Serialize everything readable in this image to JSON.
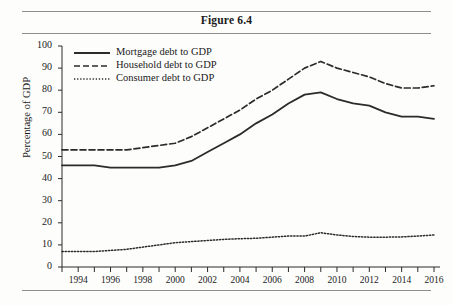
{
  "figure": {
    "title": "Figure 6.4"
  },
  "chart_data": {
    "type": "line",
    "title": "Figure 6.4",
    "xlabel": "",
    "ylabel": "Percentage of GDP",
    "xlim": [
      1993,
      2016
    ],
    "ylim": [
      0,
      100
    ],
    "grid": false,
    "legend_position": "top-left inside plot",
    "y_ticks": [
      0,
      10,
      20,
      30,
      40,
      50,
      60,
      70,
      80,
      90,
      100
    ],
    "y_tick_labels": [
      "0",
      "10",
      "20",
      "30",
      "40",
      "50",
      "60",
      "70",
      "80",
      "90",
      "100"
    ],
    "x_ticks": [
      1994,
      1996,
      1998,
      2000,
      2002,
      2004,
      2006,
      2008,
      2010,
      2012,
      2014,
      2016
    ],
    "x_tick_labels": [
      "1994",
      "1996",
      "1998",
      "2000",
      "2002",
      "2004",
      "2006",
      "2008",
      "2010",
      "2012",
      "2014",
      "2016"
    ],
    "x_minor_ticks": [
      1993,
      1994,
      1995,
      1996,
      1997,
      1998,
      1999,
      2000,
      2001,
      2002,
      2003,
      2004,
      2005,
      2006,
      2007,
      2008,
      2009,
      2010,
      2011,
      2012,
      2013,
      2014,
      2015,
      2016
    ],
    "x": [
      1993,
      1994,
      1995,
      1996,
      1997,
      1998,
      1999,
      2000,
      2001,
      2002,
      2003,
      2004,
      2005,
      2006,
      2007,
      2008,
      2009,
      2010,
      2011,
      2012,
      2013,
      2014,
      2015,
      2016
    ],
    "series": [
      {
        "name": "Mortgage debt to GDP",
        "style": "solid",
        "color": "#2b2b2b",
        "values": [
          46,
          46,
          46,
          45,
          45,
          45,
          45,
          46,
          48,
          52,
          56,
          60,
          65,
          69,
          74,
          78,
          79,
          76,
          74,
          73,
          70,
          68,
          68,
          67
        ]
      },
      {
        "name": "Household debt to GDP",
        "style": "dashed",
        "color": "#2b2b2b",
        "values": [
          53,
          53,
          53,
          53,
          53,
          54,
          55,
          56,
          59,
          63,
          67,
          71,
          76,
          80,
          85,
          90,
          93,
          90,
          88,
          86,
          83,
          81,
          81,
          82
        ]
      },
      {
        "name": "Consumer debt to GDP",
        "style": "dotted",
        "color": "#2b2b2b",
        "values": [
          7,
          7,
          7,
          7.5,
          8,
          9,
          10,
          11,
          11.5,
          12,
          12.5,
          12.8,
          13,
          13.5,
          14,
          14,
          15.5,
          14.5,
          13.8,
          13.5,
          13.5,
          13.6,
          14,
          14.5
        ]
      }
    ]
  },
  "legend": {
    "items": [
      {
        "label": "Mortgage debt to GDP",
        "style": "solid"
      },
      {
        "label": "Household debt to GDP",
        "style": "dashed"
      },
      {
        "label": "Consumer debt to GDP",
        "style": "dotted"
      }
    ]
  },
  "axes": {
    "y_title": "Percentage of GDP"
  }
}
